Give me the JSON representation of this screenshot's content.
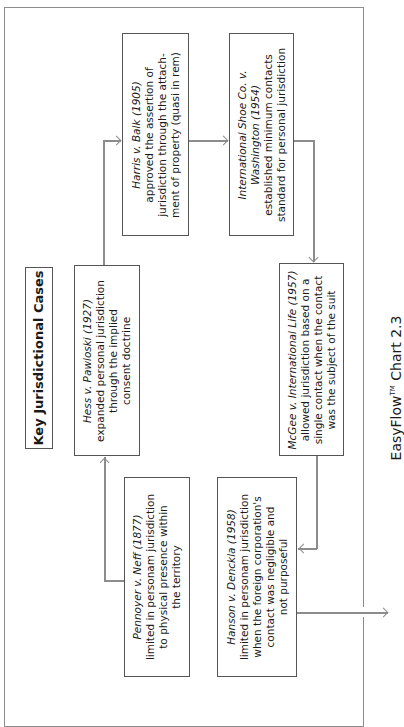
{
  "diagram": {
    "title": "Key Jurisdictional Cases",
    "orientation": "rotated 90° counter-clockwise",
    "caption": {
      "brand": "EasyFlow",
      "trademark": "TM",
      "label": "Chart 2.3"
    },
    "line_color": "#8c8c8c",
    "border_color": "#555555",
    "cases": [
      {
        "id": "pennoyer",
        "name": "Pennoyer v. Neff (1877)",
        "lines": [
          "limited in personam jurisdiction",
          "to physical presence within",
          "the territory"
        ]
      },
      {
        "id": "hess",
        "name": "Hess v. Pawloski (1927)",
        "lines": [
          "expanded personal jurisdiction",
          "through the implied",
          "consent doctrine"
        ]
      },
      {
        "id": "harris",
        "name": "Harris v. Balk (1905)",
        "lines": [
          "approved the assertion of",
          "jurisdiction through the attach-",
          "ment of property (quasi in rem)"
        ]
      },
      {
        "id": "intl-shoe",
        "name_line1": "International Shoe Co. v.",
        "name_line2": "Washington (1954)",
        "lines": [
          "established minimum contacts",
          "standard for personal jurisdiction"
        ]
      },
      {
        "id": "mcgee",
        "name": "McGee v. International Life (1957)",
        "lines": [
          "allowed jurisdiction based on a",
          "single contact when the contact",
          "was the subject of the suit"
        ]
      },
      {
        "id": "hanson",
        "name": "Hanson v. Denckla (1958)",
        "lines": [
          "limited in personam jurisdiction",
          "when the foreign corporation's",
          "contact was negligible and",
          "not purposeful"
        ]
      }
    ],
    "flow": [
      {
        "from": "pennoyer",
        "to": "hess"
      },
      {
        "from": "hess",
        "to": "harris"
      },
      {
        "from": "harris",
        "to": "intl-shoe"
      },
      {
        "from": "intl-shoe",
        "to": "mcgee"
      },
      {
        "from": "mcgee",
        "to": "hanson"
      },
      {
        "from": "hanson",
        "to": "off-page"
      }
    ]
  }
}
